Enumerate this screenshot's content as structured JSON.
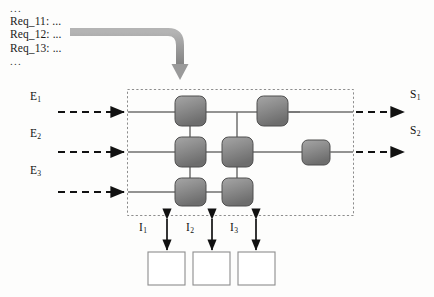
{
  "diagram": {
    "title_block": {
      "dots_top": "...",
      "lines": [
        "Req_11: ...",
        "Req_12: ...",
        "Req_13: ..."
      ],
      "dots_bottom": "..."
    },
    "inputs": [
      {
        "name": "E",
        "index": "1",
        "label": "E"
      },
      {
        "name": "E",
        "index": "2",
        "label": "E"
      },
      {
        "name": "E",
        "index": "3",
        "label": "E"
      }
    ],
    "outputs": [
      {
        "name": "S",
        "index": "1",
        "label": "S"
      },
      {
        "name": "S",
        "index": "2",
        "label": "S"
      }
    ],
    "interfaces": [
      {
        "name": "I",
        "index": "1",
        "label": "I"
      },
      {
        "name": "I",
        "index": "2",
        "label": "I"
      },
      {
        "name": "I",
        "index": "3",
        "label": "I"
      }
    ],
    "nodes": [
      {
        "id": "n-r1-c1",
        "row": 1,
        "col": 1
      },
      {
        "id": "n-r1-c3",
        "row": 1,
        "col": 3
      },
      {
        "id": "n-r2-c1",
        "row": 2,
        "col": 1
      },
      {
        "id": "n-r2-c2",
        "row": 2,
        "col": 2
      },
      {
        "id": "n-r2-c4",
        "row": 2,
        "col": 4
      },
      {
        "id": "n-r3-c1",
        "row": 3,
        "col": 1
      },
      {
        "id": "n-r3-c2",
        "row": 3,
        "col": 2
      }
    ],
    "external_boxes": [
      {
        "id": "ext-1"
      },
      {
        "id": "ext-2"
      },
      {
        "id": "ext-3"
      }
    ],
    "colors": {
      "node_fill_light": "#9a9a9a",
      "node_fill_dark": "#6e6e6e",
      "node_stroke": "#4a4a4a",
      "connector": "#6a6a6a",
      "boundary": "#8a8a8a",
      "arrow_dashed": "#111111",
      "big_arrow": "#9b9b9b",
      "external_box_stroke": "#8d8d8d",
      "external_box_fill": "#ffffff",
      "text": "#111111"
    }
  }
}
